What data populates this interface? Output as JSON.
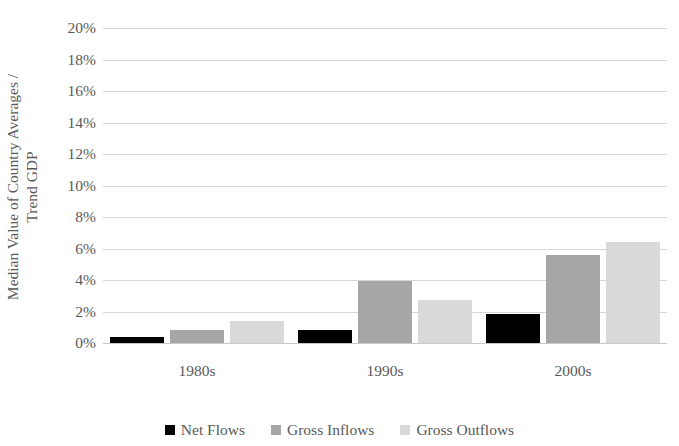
{
  "chart_data": {
    "type": "bar",
    "title": "",
    "xlabel": "",
    "ylabel": "Median Value of Country Averages /\nTrend GDP",
    "categories": [
      "1980s",
      "1990s",
      "2000s"
    ],
    "series": [
      {
        "name": "Net Flows",
        "color": "#000000",
        "values": [
          0.4,
          0.8,
          1.85
        ]
      },
      {
        "name": "Gross Inflows",
        "color": "#A6A6A6",
        "values": [
          0.85,
          3.95,
          5.6
        ]
      },
      {
        "name": "Gross Outflows",
        "color": "#D9D9D9",
        "values": [
          1.4,
          2.75,
          6.4
        ]
      }
    ],
    "ylim": [
      0,
      20
    ],
    "ytick_values": [
      0,
      2,
      4,
      6,
      8,
      10,
      12,
      14,
      16,
      18,
      20
    ],
    "ytick_labels": [
      "0%",
      "2%",
      "4%",
      "6%",
      "8%",
      "10%",
      "12%",
      "14%",
      "16%",
      "18%",
      "20%"
    ],
    "grid": true,
    "legend_position": "bottom",
    "value_suffix": "%"
  },
  "axis": {
    "y_title": "Median Value of Country Averages /\nTrend GDP"
  },
  "legend": {
    "items": [
      {
        "label": "Net Flows",
        "color": "#000000"
      },
      {
        "label": "Gross Inflows",
        "color": "#A6A6A6"
      },
      {
        "label": "Gross Outflows",
        "color": "#D9D9D9"
      }
    ]
  },
  "colors": {
    "net_flows": "#000000",
    "gross_inflows": "#A6A6A6",
    "gross_outflows": "#D9D9D9",
    "gridline": "#D6D6D6",
    "text": "#595959",
    "background": "#FFFFFF"
  }
}
